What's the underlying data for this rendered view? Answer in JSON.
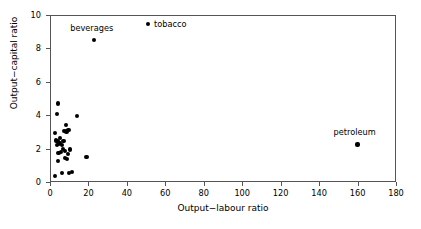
{
  "chart_data": {
    "type": "scatter",
    "title": "",
    "xlabel": "Output−labour ratio",
    "ylabel": "Output−capital ratio",
    "xlim": [
      0,
      180
    ],
    "ylim": [
      0,
      10
    ],
    "xticks": [
      0,
      20,
      40,
      60,
      80,
      100,
      120,
      140,
      160,
      180
    ],
    "yticks": [
      0,
      2,
      4,
      6,
      8,
      10
    ],
    "grid": false,
    "legend": null,
    "marker": "filled-circle",
    "marker_color": "#000000",
    "annotations": [
      {
        "text": "tobacco",
        "x": 51,
        "y": 9.45,
        "position": "right"
      },
      {
        "text": "beverages",
        "x": 23,
        "y": 8.5,
        "position": "above-left"
      },
      {
        "text": "petroleum",
        "x": 160,
        "y": 2.25,
        "position": "above-left"
      }
    ],
    "points": [
      {
        "x": 51,
        "y": 9.45,
        "label": "tobacco"
      },
      {
        "x": 23,
        "y": 8.5,
        "label": "beverages"
      },
      {
        "x": 160,
        "y": 2.25,
        "label": "petroleum"
      },
      {
        "x": 4.0,
        "y": 4.7,
        "label": ""
      },
      {
        "x": 3.6,
        "y": 4.05,
        "label": ""
      },
      {
        "x": 14.0,
        "y": 3.95,
        "label": ""
      },
      {
        "x": 8.2,
        "y": 3.4,
        "label": ""
      },
      {
        "x": 2.8,
        "y": 2.92,
        "label": ""
      },
      {
        "x": 7.4,
        "y": 3.05,
        "label": ""
      },
      {
        "x": 9.6,
        "y": 3.1,
        "label": ""
      },
      {
        "x": 8.6,
        "y": 3.02,
        "label": ""
      },
      {
        "x": 5.0,
        "y": 2.62,
        "label": ""
      },
      {
        "x": 3.3,
        "y": 2.48,
        "label": ""
      },
      {
        "x": 4.2,
        "y": 2.42,
        "label": ""
      },
      {
        "x": 4.6,
        "y": 2.3,
        "label": ""
      },
      {
        "x": 3.8,
        "y": 2.22,
        "label": ""
      },
      {
        "x": 5.4,
        "y": 2.35,
        "label": ""
      },
      {
        "x": 6.2,
        "y": 2.2,
        "label": ""
      },
      {
        "x": 7.0,
        "y": 2.45,
        "label": ""
      },
      {
        "x": 6.6,
        "y": 1.98,
        "label": ""
      },
      {
        "x": 5.8,
        "y": 1.8,
        "label": ""
      },
      {
        "x": 4.4,
        "y": 1.72,
        "label": ""
      },
      {
        "x": 8.0,
        "y": 1.88,
        "label": ""
      },
      {
        "x": 9.2,
        "y": 1.7,
        "label": ""
      },
      {
        "x": 10.4,
        "y": 1.95,
        "label": ""
      },
      {
        "x": 7.8,
        "y": 1.42,
        "label": ""
      },
      {
        "x": 9.0,
        "y": 1.38,
        "label": ""
      },
      {
        "x": 19.0,
        "y": 1.5,
        "label": ""
      },
      {
        "x": 4.0,
        "y": 1.25,
        "label": ""
      },
      {
        "x": 2.4,
        "y": 0.35,
        "label": ""
      },
      {
        "x": 6.4,
        "y": 0.52,
        "label": ""
      },
      {
        "x": 10.0,
        "y": 0.55,
        "label": ""
      },
      {
        "x": 11.4,
        "y": 0.58,
        "label": ""
      }
    ]
  }
}
